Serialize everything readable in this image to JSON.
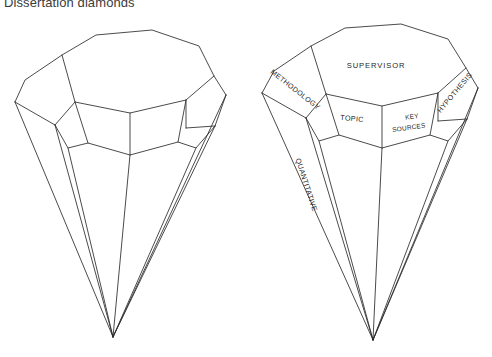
{
  "figure": {
    "title": "Dissertation diamonds"
  },
  "diagrams": [
    {
      "name": "blank-diamond",
      "caption": "",
      "labels": []
    },
    {
      "name": "labelled-diamond",
      "caption": "",
      "labels": [
        {
          "key": "table",
          "text": "SUPERVISOR"
        },
        {
          "key": "crown_left",
          "text": "METHODOLOGY"
        },
        {
          "key": "crown_mid_l",
          "text": "TOPIC"
        },
        {
          "key": "crown_mid_r1",
          "text": "KEY"
        },
        {
          "key": "crown_mid_r2",
          "text": "SOURCES"
        },
        {
          "key": "crown_right",
          "text": "HYPOTHESIS"
        },
        {
          "key": "pavilion",
          "text": "QUANTITATIVE"
        }
      ]
    }
  ],
  "colors": {
    "background": "#ffffff",
    "stroke": "#2b2b2b",
    "text": "#1f1f1f",
    "title": "#3b3b3b"
  }
}
